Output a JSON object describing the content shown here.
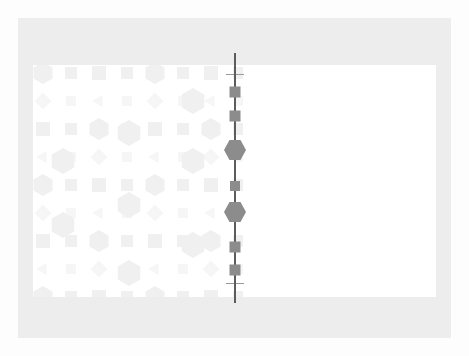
{
  "figure": {
    "title": "",
    "background_color": "#fdfdfd",
    "frame_color": "#ededed",
    "panel_color": "#ffffff",
    "axis_color": "#5c5c5c",
    "marker_color": "#8c8c8c",
    "pattern_color": "#f1f1f1"
  },
  "chart_data": {
    "type": "scatter",
    "title": "",
    "xlabel": "",
    "ylabel": "",
    "grid": false,
    "legend": null,
    "axis": {
      "orientation": "vertical",
      "x": 235,
      "y_start": 53,
      "y_end": 303,
      "color": "#5c5c5c",
      "cap_top_y": 74,
      "cap_bottom_y": 283,
      "cap_width": 18,
      "cap_color": "#9a9a9a"
    },
    "x": [
      235,
      235,
      235,
      235,
      235,
      235,
      235
    ],
    "y": [
      92,
      116,
      150,
      186,
      212,
      247,
      270
    ],
    "series": [
      {
        "name": "markers",
        "points": [
          {
            "x": 235,
            "y": 92,
            "shape": "square",
            "size": 11,
            "color": "#8c8c8c"
          },
          {
            "x": 235,
            "y": 116,
            "shape": "square",
            "size": 11,
            "color": "#8c8c8c"
          },
          {
            "x": 235,
            "y": 150,
            "shape": "hex",
            "size": 22,
            "color": "#8c8c8c"
          },
          {
            "x": 235,
            "y": 186,
            "shape": "square",
            "size": 10,
            "color": "#8c8c8c"
          },
          {
            "x": 235,
            "y": 212,
            "shape": "hex",
            "size": 22,
            "color": "#8c8c8c"
          },
          {
            "x": 235,
            "y": 247,
            "shape": "square",
            "size": 11,
            "color": "#8c8c8c"
          },
          {
            "x": 235,
            "y": 270,
            "shape": "square",
            "size": 11,
            "color": "#8c8c8c"
          }
        ]
      }
    ]
  },
  "pattern": {
    "description": "faint decorative lattice of squares, hexagons, triangles and diamonds",
    "color": "#f0f0f0",
    "color_light": "#f6f6f6",
    "cell": 28,
    "columns": 8,
    "rows": 9
  }
}
